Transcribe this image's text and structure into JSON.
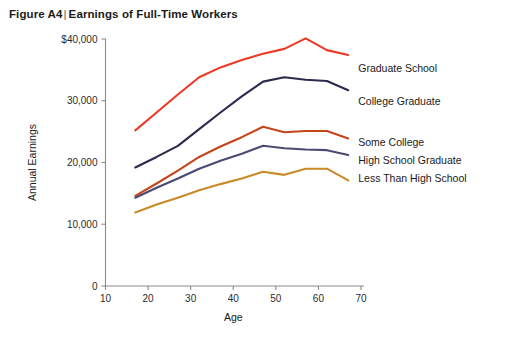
{
  "figure": {
    "label": "Figure A4",
    "separator": "|",
    "title": "Earnings of Full-Time Workers"
  },
  "chart_data": {
    "type": "line",
    "title": "Earnings of Full-Time Workers",
    "subtitle": "Figure A4",
    "xlabel": "Age",
    "ylabel": "Annual Earnings",
    "xlim": [
      10,
      70
    ],
    "ylim": [
      0,
      40000
    ],
    "xticks": [
      10,
      20,
      30,
      40,
      50,
      60,
      70
    ],
    "xticklabels": [
      "10",
      "20",
      "30",
      "40",
      "50",
      "60",
      "70"
    ],
    "yticks": [
      0,
      10000,
      20000,
      30000,
      40000
    ],
    "yticklabels": [
      "0",
      "10,000",
      "20,000",
      "30,000",
      "$40,000"
    ],
    "grid": false,
    "legend_position": "right-inline-labels",
    "x": [
      17,
      22,
      27,
      32,
      37,
      42,
      47,
      52,
      57,
      62,
      67
    ],
    "series": [
      {
        "name": "Graduate School",
        "color": "#ED3A26",
        "label_y_value": 35200,
        "values": [
          25200,
          28100,
          31000,
          33800,
          35400,
          36600,
          37600,
          38400,
          40100,
          38200,
          37400
        ]
      },
      {
        "name": "College Graduate",
        "color": "#2B2B4F",
        "label_y_value": 29900,
        "values": [
          19200,
          20900,
          22700,
          25400,
          28100,
          30700,
          33100,
          33800,
          33400,
          33200,
          31700
        ]
      },
      {
        "name": "Some College",
        "color": "#C4451C",
        "label_y_value": 23200,
        "values": [
          14600,
          16600,
          18700,
          20900,
          22600,
          24100,
          25800,
          24900,
          25100,
          25100,
          23900
        ]
      },
      {
        "name": "High School Graduate",
        "color": "#4A4A73",
        "label_y_value": 20300,
        "values": [
          14300,
          15900,
          17400,
          19000,
          20300,
          21400,
          22700,
          22300,
          22100,
          22000,
          21200
        ]
      },
      {
        "name": "Less Than High School",
        "color": "#C98A28",
        "label_y_value": 17400,
        "values": [
          11900,
          13200,
          14300,
          15500,
          16500,
          17400,
          18500,
          18000,
          19000,
          19000,
          17100
        ]
      }
    ]
  }
}
